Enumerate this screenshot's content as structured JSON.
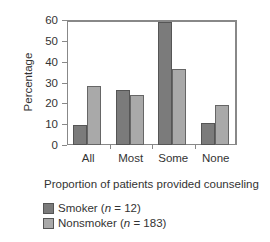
{
  "chart_data": {
    "type": "bar",
    "title": "",
    "xlabel": "Proportion of patients provided counseling",
    "ylabel": "Percentage",
    "ylim": [
      0,
      60
    ],
    "yticks": [
      0,
      10,
      20,
      30,
      40,
      50,
      60
    ],
    "categories": [
      "All",
      "Most",
      "Some",
      "None"
    ],
    "series": [
      {
        "name": "Smoker (n = 12)",
        "label_prefix": "Smoker (",
        "label_n": "n",
        "label_suffix": " = 12)",
        "color": "#7b7b7b",
        "values": [
          9.5,
          26.5,
          59,
          10.5
        ]
      },
      {
        "name": "Nonsmoker (n = 183)",
        "label_prefix": "Nonsmoker (",
        "label_n": "n",
        "label_suffix": " = 183)",
        "color": "#a9a9a9",
        "values": [
          28.5,
          24,
          36.5,
          19
        ]
      }
    ],
    "legend_position": "bottom-left",
    "grid": false
  }
}
